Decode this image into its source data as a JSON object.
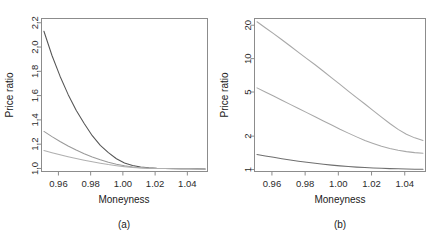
{
  "figure": {
    "panels": [
      {
        "id": "a",
        "caption": "(a)",
        "xlabel": "Moneyness",
        "ylabel": "Price ratio"
      },
      {
        "id": "b",
        "caption": "(b)",
        "xlabel": "Moneyness",
        "ylabel": "Price ratio"
      }
    ]
  },
  "chart_data": [
    {
      "type": "line",
      "panel": "(a)",
      "title": "",
      "xlabel": "Moneyness",
      "ylabel": "Price ratio",
      "xlim": [
        0.9495,
        1.0525
      ],
      "ylim": [
        0.975,
        2.235
      ],
      "yscale": "linear",
      "xticks": [
        0.96,
        0.98,
        1.0,
        1.02,
        1.04
      ],
      "xticklabels": [
        "0.96",
        "0.98",
        "1.00",
        "1.02",
        "1.04"
      ],
      "yticks": [
        1.0,
        1.2,
        1.4,
        1.6,
        1.8,
        2.0,
        2.2
      ],
      "yticklabels": [
        "1.0",
        "1.2",
        "1.4",
        "1.6",
        "1.8",
        "2.0",
        "2.2"
      ],
      "grid": false,
      "legend": "none",
      "x": [
        0.951,
        0.956,
        0.961,
        0.966,
        0.971,
        0.976,
        0.981,
        0.986,
        0.991,
        0.996,
        1.001,
        1.006,
        1.011,
        1.016,
        1.021,
        1.026,
        1.031,
        1.036,
        1.041,
        1.046,
        1.051
      ],
      "series": [
        {
          "name": "curve-1",
          "color": "#555555",
          "values": [
            2.13,
            1.93,
            1.76,
            1.61,
            1.48,
            1.37,
            1.27,
            1.19,
            1.13,
            1.08,
            1.045,
            1.025,
            1.012,
            1.006,
            1.002,
            1.0,
            0.999,
            0.998,
            0.997,
            0.997,
            0.996
          ]
        },
        {
          "name": "curve-2",
          "color": "#9a9a9a",
          "values": [
            1.305,
            1.262,
            1.222,
            1.185,
            1.152,
            1.122,
            1.095,
            1.072,
            1.052,
            1.035,
            1.022,
            1.012,
            1.006,
            1.002,
            1.0,
            0.999,
            0.998,
            0.997,
            0.997,
            0.996,
            0.996
          ]
        },
        {
          "name": "curve-3",
          "color": "#b0b0b0",
          "values": [
            1.148,
            1.13,
            1.113,
            1.097,
            1.082,
            1.068,
            1.055,
            1.043,
            1.032,
            1.023,
            1.015,
            1.009,
            1.005,
            1.002,
            1.0,
            0.999,
            0.998,
            0.997,
            0.997,
            0.996,
            0.996
          ]
        }
      ]
    },
    {
      "type": "line",
      "panel": "(b)",
      "title": "",
      "xlabel": "Moneyness",
      "ylabel": "Price ratio",
      "xlim": [
        0.9495,
        1.0525
      ],
      "ylim": [
        0.96,
        23.0
      ],
      "yscale": "log",
      "xticks": [
        0.96,
        0.98,
        1.0,
        1.02,
        1.04
      ],
      "xticklabels": [
        "0.96",
        "0.98",
        "1.00",
        "1.02",
        "1.04"
      ],
      "yticks": [
        1,
        2,
        5,
        10,
        20
      ],
      "yticklabels": [
        "1",
        "2",
        "5",
        "10",
        "20"
      ],
      "grid": false,
      "legend": "none",
      "x": [
        0.951,
        0.956,
        0.961,
        0.966,
        0.971,
        0.976,
        0.981,
        0.986,
        0.991,
        0.996,
        1.001,
        1.006,
        1.011,
        1.016,
        1.021,
        1.026,
        1.031,
        1.036,
        1.041,
        1.046,
        1.051
      ],
      "series": [
        {
          "name": "curve-1",
          "color": "#a8a8a8",
          "values": [
            21.5,
            19.0,
            16.8,
            14.8,
            13.0,
            11.4,
            10.0,
            8.8,
            7.7,
            6.7,
            5.85,
            5.1,
            4.45,
            3.9,
            3.4,
            2.97,
            2.6,
            2.3,
            2.08,
            1.93,
            1.83
          ]
        },
        {
          "name": "curve-2",
          "color": "#a8a8a8",
          "values": [
            5.45,
            5.0,
            4.6,
            4.22,
            3.87,
            3.55,
            3.26,
            2.99,
            2.74,
            2.52,
            2.31,
            2.13,
            1.97,
            1.83,
            1.72,
            1.62,
            1.55,
            1.49,
            1.45,
            1.42,
            1.4
          ]
        },
        {
          "name": "curve-3",
          "color": "#6f6f6f",
          "values": [
            1.365,
            1.325,
            1.288,
            1.253,
            1.22,
            1.19,
            1.163,
            1.138,
            1.116,
            1.096,
            1.079,
            1.064,
            1.051,
            1.041,
            1.032,
            1.025,
            1.019,
            1.015,
            1.011,
            1.008,
            1.006
          ]
        }
      ]
    }
  ]
}
